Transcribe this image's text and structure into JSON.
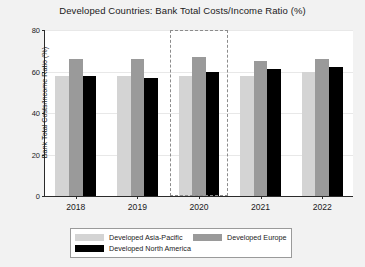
{
  "chart_data": {
    "type": "bar",
    "title": "Developed Countries: Bank Total Costs/Income Ratio (%)",
    "xlabel": "",
    "ylabel": "Bank Total Costs/Income Ratio (%)",
    "categories": [
      "2018",
      "2019",
      "2020",
      "2021",
      "2022"
    ],
    "series": [
      {
        "name": "Developed Asia-Pacific",
        "color": "#d4d4d4",
        "values": [
          58,
          58,
          58,
          58,
          60
        ]
      },
      {
        "name": "Developed Europe",
        "color": "#9a9a9a",
        "values": [
          66,
          66,
          67,
          65,
          66
        ]
      },
      {
        "name": "Developed North America",
        "color": "#000000",
        "values": [
          58,
          57,
          60,
          61,
          62
        ]
      }
    ],
    "ylim": [
      0,
      80
    ],
    "yticks": [
      0,
      20,
      40,
      60,
      80
    ],
    "grid": true,
    "legend_position": "bottom",
    "annotations": [
      {
        "type": "highlight-box",
        "category": "2020",
        "style": "dashed",
        "color": "#8c8c8c"
      }
    ]
  },
  "legend": {
    "entries": [
      {
        "label": "Developed Asia-Pacific"
      },
      {
        "label": "Developed Europe"
      },
      {
        "label": "Developed North America"
      }
    ]
  }
}
